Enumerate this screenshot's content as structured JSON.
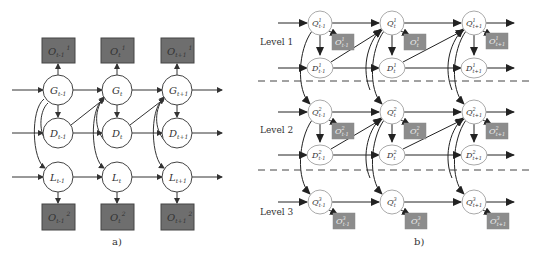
{
  "panel_a": {
    "caption": "a)",
    "colors": {
      "box_fill": "#6e6e6e",
      "node_stroke": "#555555",
      "edge": "#333333"
    },
    "columns": [
      {
        "g": "G",
        "g_sub": "t-1",
        "d": "D",
        "d_sub": "t-1",
        "l": "L",
        "l_sub": "t-1",
        "o1": "O",
        "o1_sub": "t-1",
        "o1_sup": "1",
        "o2": "O",
        "o2_sub": "t-1",
        "o2_sup": "2"
      },
      {
        "g": "G",
        "g_sub": "t",
        "d": "D",
        "d_sub": "t",
        "l": "L",
        "l_sub": "t",
        "o1": "O",
        "o1_sub": "t",
        "o1_sup": "1",
        "o2": "O",
        "o2_sub": "t",
        "o2_sup": "2"
      },
      {
        "g": "G",
        "g_sub": "t+1",
        "d": "D",
        "d_sub": "t+1",
        "l": "L",
        "l_sub": "t+1",
        "o1": "O",
        "o1_sub": "t+1",
        "o1_sup": "1",
        "o2": "O",
        "o2_sub": "t+1",
        "o2_sup": "2"
      }
    ]
  },
  "panel_b": {
    "caption": "b)",
    "levels": [
      {
        "label": "Level 1",
        "sup": "1"
      },
      {
        "label": "Level 2",
        "sup": "2"
      },
      {
        "label": "Level 3",
        "sup": "3"
      }
    ],
    "time_subs": [
      "t-1",
      "t",
      "t+1"
    ],
    "node_names": {
      "q": "Q",
      "d": "D",
      "o": "O"
    },
    "colors": {
      "box_fill": "#8c8c8c",
      "node_stroke": "#aaaaaa",
      "dash": "#444444"
    }
  }
}
